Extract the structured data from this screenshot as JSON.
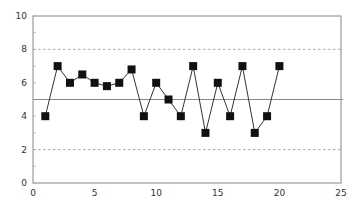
{
  "chart_data": {
    "type": "line",
    "title": "",
    "xlabel": "",
    "ylabel": "",
    "xlim": [
      0,
      25
    ],
    "ylim": [
      0,
      10
    ],
    "x_ticks": [
      0,
      5,
      10,
      15,
      20,
      25
    ],
    "y_ticks": [
      0,
      2,
      4,
      6,
      8,
      10
    ],
    "grid": false,
    "legend": null,
    "series": [
      {
        "name": "observations",
        "marker": "square",
        "x": [
          1,
          2,
          3,
          4,
          5,
          6,
          7,
          8,
          9,
          10,
          11,
          12,
          13,
          14,
          15,
          16,
          17,
          18,
          19,
          20
        ],
        "values": [
          4,
          7,
          6,
          6.5,
          6,
          5.8,
          6,
          6.8,
          4,
          6,
          5,
          4,
          7,
          3,
          6,
          4,
          7,
          3,
          4,
          7
        ]
      }
    ],
    "reference_lines": [
      {
        "name": "upper-control-limit",
        "y": 8,
        "style": "dashed"
      },
      {
        "name": "center-line",
        "y": 5,
        "style": "solid"
      },
      {
        "name": "lower-control-limit",
        "y": 2,
        "style": "dashed"
      }
    ]
  },
  "colors": {
    "frame": "#9a9a9a",
    "marker": "#111111",
    "line": "#333333",
    "center_line": "#8a8a8a",
    "limit_line": "#a0a0a0"
  }
}
